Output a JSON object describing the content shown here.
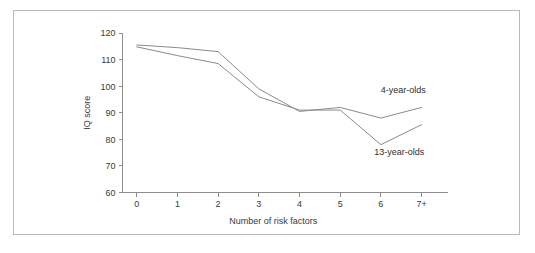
{
  "figure": {
    "background_color": "#ffffff",
    "frame_color": "#b9b9b9",
    "line_color": "#8a8a8a",
    "axis_color": "#8e8e8e",
    "text_color": "#3a3a3a"
  },
  "chart_data": {
    "type": "line",
    "title": "",
    "xlabel": "Number of risk factors",
    "ylabel": "IQ score",
    "categories": [
      "0",
      "1",
      "2",
      "3",
      "4",
      "5",
      "6",
      "7+"
    ],
    "x": [
      0,
      1,
      2,
      3,
      4,
      5,
      6,
      7
    ],
    "xtick_labels": [
      "0",
      "1",
      "2",
      "3",
      "4",
      "5",
      "6",
      "7+"
    ],
    "ytick_labels": [
      "60",
      "70",
      "80",
      "90",
      "100",
      "110",
      "120"
    ],
    "ytick_values": [
      60,
      70,
      80,
      90,
      100,
      110,
      120
    ],
    "ylim": [
      60,
      120
    ],
    "xlim": [
      -0.35,
      7.65
    ],
    "grid": false,
    "legend_position": "inline-annotations",
    "series": [
      {
        "name": "4-year-olds",
        "label": "4-year-olds",
        "color": "#8a8a8a",
        "values": [
          115.5,
          114.5,
          113.0,
          99.0,
          90.5,
          92.0,
          88.0,
          92.0
        ]
      },
      {
        "name": "13-year-olds",
        "label": "13-year-olds",
        "color": "#8a8a8a",
        "values": [
          114.8,
          111.5,
          108.5,
          96.0,
          91.0,
          91.0,
          78.0,
          85.5
        ]
      }
    ],
    "annotations": [
      {
        "text": "4-year-olds",
        "series": "4-year-olds",
        "x": 6.55,
        "y": 97.5
      },
      {
        "text": "13-year-olds",
        "series": "13-year-olds",
        "x": 6.45,
        "y": 74.0
      }
    ]
  }
}
